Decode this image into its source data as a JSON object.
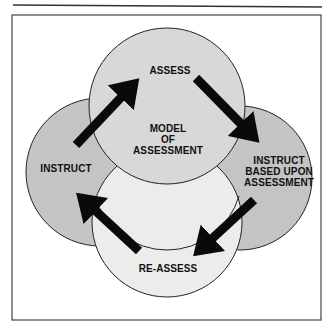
{
  "diagram": {
    "center_label": [
      "MODEL",
      "OF",
      "ASSESSMENT"
    ],
    "nodes": [
      {
        "id": "assess",
        "label": "ASSESS",
        "fill": "#d6d6d6"
      },
      {
        "id": "instruct-based",
        "label": [
          "INSTRUCT",
          "BASED UPON",
          "ASSESSMENT"
        ],
        "fill": "#c4c4c4"
      },
      {
        "id": "re-assess",
        "label": "RE-ASSESS",
        "fill": "#ececec"
      },
      {
        "id": "instruct",
        "label": "INSTRUCT",
        "fill": "#c4c4c4"
      }
    ],
    "edges": [
      {
        "from": "instruct",
        "to": "assess"
      },
      {
        "from": "assess",
        "to": "instruct-based"
      },
      {
        "from": "instruct-based",
        "to": "re-assess"
      },
      {
        "from": "re-assess",
        "to": "instruct"
      }
    ],
    "colors": {
      "frame": "#333333",
      "arrow": "#0a0a0a",
      "outline": "#222222"
    }
  }
}
